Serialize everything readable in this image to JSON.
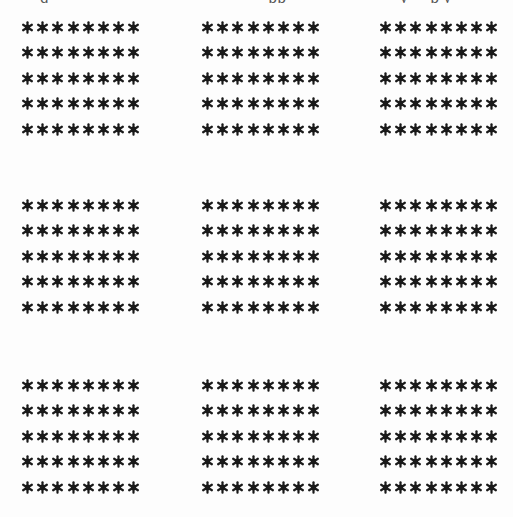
{
  "page": {
    "background": "#fdfdfd",
    "ink_color": "#1a1a1a",
    "top_cut_text_fragments": [
      "g",
      "pp",
      "y",
      "p y"
    ]
  },
  "figure": {
    "symbol": "asterisk",
    "symbol_glyph": "✱",
    "blocks_grid": {
      "rows": 3,
      "cols": 3
    },
    "block_shape": {
      "rows": 5,
      "cols": 8
    },
    "blocks": [
      {
        "id": "block-1-1",
        "x": 20,
        "y": 20,
        "rows": 5,
        "cols": 8
      },
      {
        "id": "block-1-2",
        "x": 200,
        "y": 20,
        "rows": 5,
        "cols": 8
      },
      {
        "id": "block-1-3",
        "x": 378,
        "y": 20,
        "rows": 5,
        "cols": 8
      },
      {
        "id": "block-2-1",
        "x": 20,
        "y": 198,
        "rows": 5,
        "cols": 8
      },
      {
        "id": "block-2-2",
        "x": 200,
        "y": 198,
        "rows": 5,
        "cols": 8
      },
      {
        "id": "block-2-3",
        "x": 378,
        "y": 198,
        "rows": 5,
        "cols": 8
      },
      {
        "id": "block-3-1",
        "x": 20,
        "y": 378,
        "rows": 5,
        "cols": 8
      },
      {
        "id": "block-3-2",
        "x": 200,
        "y": 378,
        "rows": 5,
        "cols": 8
      },
      {
        "id": "block-3-3",
        "x": 378,
        "y": 378,
        "rows": 5,
        "cols": 8
      }
    ],
    "row_pitch_px": 25.5,
    "col_pitch_px": 15.2,
    "total_symbols": 360
  }
}
